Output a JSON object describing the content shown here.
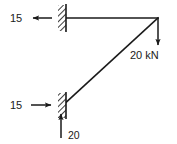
{
  "diagram": {
    "type": "free-body-diagram",
    "title": "",
    "background_color": "#ffffff",
    "line_color": "#1a1a1a",
    "members": [
      {
        "name": "top-horizontal-member",
        "from": [
          61,
          18
        ],
        "to": [
          158,
          18
        ]
      },
      {
        "name": "diagonal-member",
        "from": [
          158,
          18
        ],
        "to": [
          62,
          106
        ]
      }
    ],
    "supports": [
      {
        "name": "upper-wall-support",
        "x": 58,
        "y_top": 5,
        "y_bottom": 31,
        "width": 8,
        "style": "hatched"
      },
      {
        "name": "lower-wall-support",
        "x": 58,
        "y_top": 93,
        "y_bottom": 118,
        "width": 8,
        "style": "hatched"
      }
    ],
    "forces": [
      {
        "name": "upper-reaction-horizontal",
        "label": "15",
        "direction": "left",
        "label_x": 10,
        "label_y": 22,
        "arrow_from": [
          52,
          18
        ],
        "arrow_to": [
          31,
          18
        ]
      },
      {
        "name": "applied-load-vertical",
        "label": "20 kN",
        "direction": "down",
        "label_x": 130,
        "label_y": 59,
        "arrow_from": [
          158,
          18
        ],
        "arrow_to": [
          158,
          47
        ]
      },
      {
        "name": "lower-reaction-horizontal",
        "label": "15",
        "direction": "right",
        "label_x": 10,
        "label_y": 109,
        "arrow_from": [
          31,
          105
        ],
        "arrow_to": [
          53,
          105
        ]
      },
      {
        "name": "lower-reaction-vertical",
        "label": "20",
        "direction": "up",
        "label_x": 68,
        "label_y": 137,
        "arrow_from": [
          61,
          137
        ],
        "arrow_to": [
          61,
          112
        ]
      }
    ]
  }
}
